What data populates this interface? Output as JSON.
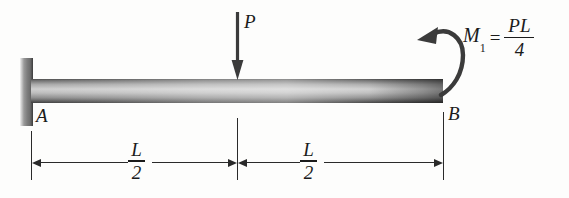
{
  "figure": {
    "type": "cantilever-beam-free-body-diagram",
    "background_color": "#fdfdfc",
    "ink_color": "#1b1b1b"
  },
  "supports": {
    "fixed_wall": {
      "name": "fixed-support",
      "at_node": "A"
    }
  },
  "nodes": {
    "left_label": "A",
    "right_label": "B"
  },
  "loads": {
    "point_load": {
      "label": "P",
      "direction": "down",
      "location": "midspan"
    },
    "moment": {
      "symbol": "M",
      "subscript": "1",
      "equals": "=",
      "numerator": "PL",
      "denominator": "4",
      "direction": "counterclockwise",
      "location": "B"
    }
  },
  "dimensions": [
    {
      "numerator": "L",
      "denominator": "2",
      "span": "A-to-midspan"
    },
    {
      "numerator": "L",
      "denominator": "2",
      "span": "midspan-to-B"
    }
  ]
}
